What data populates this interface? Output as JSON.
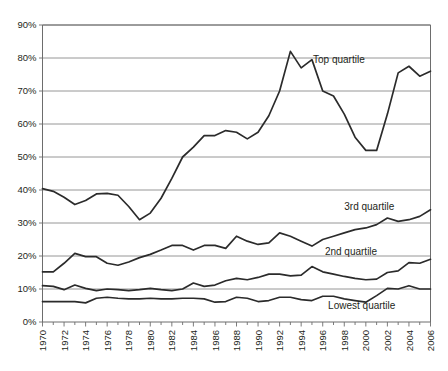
{
  "chart_data": {
    "type": "line",
    "title": "",
    "subtitle": "",
    "xlabel": "",
    "ylabel": "",
    "grid": "horizontal",
    "legend_position": "inline-annotations",
    "xlim": [
      1970,
      2006
    ],
    "ylim": [
      0,
      90
    ],
    "y_tick_labels": [
      "0%",
      "10%",
      "20%",
      "30%",
      "40%",
      "50%",
      "60%",
      "70%",
      "80%",
      "90%"
    ],
    "y_tick_values": [
      0,
      10,
      20,
      30,
      40,
      50,
      60,
      70,
      80,
      90
    ],
    "x_tick_labels": [
      "1970",
      "1972",
      "1974",
      "1976",
      "1978",
      "1980",
      "1982",
      "1984",
      "1986",
      "1988",
      "1990",
      "1992",
      "1994",
      "1996",
      "1998",
      "2000",
      "2002",
      "2004",
      "2006"
    ],
    "x_tick_values": [
      1970,
      1972,
      1974,
      1976,
      1978,
      1980,
      1982,
      1984,
      1986,
      1988,
      1990,
      1992,
      1994,
      1996,
      1998,
      2000,
      2002,
      2004,
      2006
    ],
    "x": [
      1970,
      1971,
      1972,
      1973,
      1974,
      1975,
      1976,
      1977,
      1978,
      1979,
      1980,
      1981,
      1982,
      1983,
      1984,
      1985,
      1986,
      1987,
      1988,
      1989,
      1990,
      1991,
      1992,
      1993,
      1994,
      1995,
      1996,
      1997,
      1998,
      1999,
      2000,
      2001,
      2002,
      2003,
      2004,
      2005,
      2006
    ],
    "series": [
      {
        "name": "Top quartile",
        "label": "Top quartile",
        "label_x": 1995.1,
        "label_y": 78.5,
        "values": [
          40.4,
          39.6,
          37.8,
          35.6,
          36.8,
          38.8,
          39.0,
          38.4,
          35.0,
          31.0,
          33.0,
          37.5,
          43.5,
          50.0,
          53.0,
          56.5,
          56.5,
          58.0,
          57.5,
          55.5,
          57.5,
          62.5,
          70.0,
          82.0,
          77.0,
          79.5,
          70.0,
          68.5,
          63.0,
          56.0,
          52.0,
          52.0,
          63.0,
          75.5,
          77.5,
          74.5,
          76.0
        ]
      },
      {
        "name": "3rd quartile",
        "label": "3rd quartile",
        "label_x": 1998.0,
        "label_y": 33.8,
        "values": [
          15.2,
          15.2,
          17.8,
          20.8,
          19.8,
          19.8,
          17.8,
          17.2,
          18.2,
          19.5,
          20.5,
          21.8,
          23.2,
          23.2,
          21.8,
          23.2,
          23.2,
          22.3,
          26.0,
          24.5,
          23.5,
          24.0,
          27.0,
          26.0,
          24.5,
          23.0,
          25.0,
          26.0,
          27.0,
          28.0,
          28.5,
          29.5,
          31.5,
          30.5,
          31.0,
          32.0,
          34.0
        ]
      },
      {
        "name": "2nd quartile",
        "label": "2nd quartile",
        "label_x": 1996.2,
        "label_y": 20.4,
        "values": [
          11.0,
          10.8,
          9.8,
          11.2,
          10.2,
          9.5,
          10.0,
          9.8,
          9.5,
          9.8,
          10.2,
          9.8,
          9.5,
          10.0,
          11.8,
          10.8,
          11.2,
          12.5,
          13.2,
          12.8,
          13.5,
          14.5,
          14.5,
          14.0,
          14.2,
          16.8,
          15.2,
          14.5,
          13.8,
          13.2,
          12.8,
          13.0,
          15.0,
          15.5,
          18.0,
          17.8,
          19.0
        ]
      },
      {
        "name": "Lowest quartile",
        "label": "Lowest quartile",
        "label_x": 1996.5,
        "label_y": 4.0,
        "values": [
          6.2,
          6.2,
          6.2,
          6.2,
          5.8,
          7.2,
          7.5,
          7.2,
          7.0,
          7.0,
          7.2,
          7.0,
          7.0,
          7.2,
          7.2,
          7.0,
          6.0,
          6.2,
          7.5,
          7.2,
          6.2,
          6.5,
          7.5,
          7.5,
          6.8,
          6.5,
          7.8,
          7.8,
          7.0,
          6.5,
          6.0,
          8.0,
          10.2,
          10.0,
          11.0,
          10.0,
          10.0
        ]
      }
    ]
  },
  "colors": {
    "line": "#2b2b2b",
    "gridline": "#8a8a8a",
    "axis": "#6d6d6d",
    "text": "#231f20",
    "background": "#ffffff"
  }
}
